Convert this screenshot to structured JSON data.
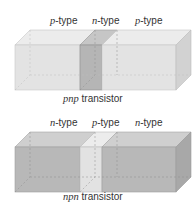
{
  "top_diagram": {
    "labels": [
      {
        "italic": "p",
        "rest": "-type"
      },
      {
        "italic": "n",
        "rest": "-type"
      },
      {
        "italic": "p",
        "rest": "-type"
      }
    ],
    "caption": {
      "italic": "pnp",
      "rest": " transistor"
    },
    "colors": {
      "outer": "#e3e3e3",
      "middle": "#b5b5b5"
    }
  },
  "bottom_diagram": {
    "labels": [
      {
        "italic": "n",
        "rest": "-type"
      },
      {
        "italic": "p",
        "rest": "-type"
      },
      {
        "italic": "n",
        "rest": "-type"
      }
    ],
    "caption": {
      "italic": "npn",
      "rest": " transistor"
    },
    "colors": {
      "outer": "#b8b8b8",
      "middle": "#e2e2e2"
    }
  }
}
